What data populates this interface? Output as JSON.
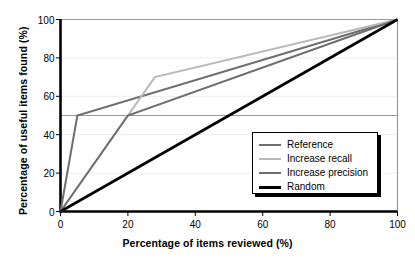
{
  "chart_data": {
    "type": "line",
    "title": "",
    "xlabel": "Percentage of items reviewed (%)",
    "ylabel": "Percentage of useful items found (%)",
    "xlim": [
      0,
      100
    ],
    "ylim": [
      0,
      100
    ],
    "xticks": [
      0,
      20,
      40,
      60,
      80,
      100
    ],
    "xtick_labels": [
      "0",
      "20",
      "40",
      "60",
      "80",
      "100"
    ],
    "yticks": [
      0,
      20,
      40,
      60,
      80,
      100
    ],
    "ytick_labels": [
      "0",
      "20",
      "40",
      "60",
      "80",
      "100"
    ],
    "grid": "horizontal",
    "legend_position": "lower right",
    "series": [
      {
        "name": "Reference",
        "color": "#6e6e6e",
        "width": 2.0,
        "points": [
          [
            0,
            0
          ],
          [
            5,
            50
          ],
          [
            100,
            100
          ]
        ]
      },
      {
        "name": "Increase recall",
        "color": "#b9b9b9",
        "width": 2.0,
        "points": [
          [
            0,
            0
          ],
          [
            28,
            70
          ],
          [
            100,
            100
          ]
        ]
      },
      {
        "name": "Increase precision",
        "color": "#6e6e6e",
        "width": 2.0,
        "points": [
          [
            0,
            0
          ],
          [
            20,
            50
          ],
          [
            100,
            100
          ]
        ]
      },
      {
        "name": "Random",
        "color": "#000000",
        "width": 2.6,
        "points": [
          [
            0,
            0
          ],
          [
            100,
            100
          ]
        ]
      }
    ]
  },
  "legend": {
    "items": [
      {
        "label": "Reference",
        "color": "#6e6e6e",
        "width": 2.2
      },
      {
        "label": "Increase recall",
        "color": "#b9b9b9",
        "width": 2.2
      },
      {
        "label": "Increase precision",
        "color": "#6e6e6e",
        "width": 2.6
      },
      {
        "label": "Random",
        "color": "#000000",
        "width": 3.0
      }
    ]
  },
  "style": {
    "axis_color": "#000000",
    "frame_color": "#9a9a9a",
    "grid_color": "#ededed",
    "midline_color": "#8f8f8f",
    "background": "#ffffff"
  }
}
